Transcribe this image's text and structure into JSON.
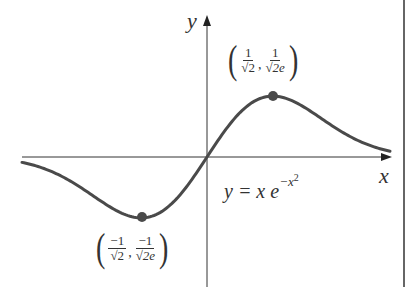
{
  "chart_data": {
    "type": "line",
    "title": "",
    "equation": "y = x e^{-x^2}",
    "xlabel": "x",
    "ylabel": "y",
    "grid": false,
    "legend": null,
    "xlim": [
      -2.0,
      2.1
    ],
    "ylim": [
      -0.9,
      1.1
    ],
    "series": [
      {
        "name": "y = x e^{-x^2}",
        "x": [
          -2.0,
          -1.75,
          -1.5,
          -1.25,
          -1.0,
          -0.75,
          -0.707,
          -0.5,
          -0.25,
          0.0,
          0.25,
          0.5,
          0.707,
          0.75,
          1.0,
          1.25,
          1.5,
          1.75,
          2.0
        ],
        "y": [
          -0.037,
          -0.082,
          -0.158,
          -0.262,
          -0.368,
          -0.427,
          -0.429,
          -0.389,
          -0.235,
          0.0,
          0.235,
          0.389,
          0.429,
          0.427,
          0.368,
          0.262,
          0.158,
          0.082,
          0.037
        ]
      }
    ],
    "annotations": [
      {
        "type": "point",
        "label": "(1/√2, 1/√(2e))",
        "x": 0.707,
        "y": 0.429,
        "role": "maximum"
      },
      {
        "type": "point",
        "label": "(−1/√2, −1/√(2e))",
        "x": -0.707,
        "y": -0.429,
        "role": "minimum"
      },
      {
        "type": "text",
        "label": "y = x e^{-x^2}",
        "position": "below x-axis, right of origin"
      }
    ]
  },
  "labels": {
    "y_axis": "y",
    "x_axis": "x",
    "equation_prefix": "y = x e",
    "equation_exp": "−x",
    "equation_exp_pow": "2",
    "max_point": {
      "x_num": "1",
      "x_den": "√2",
      "y_num": "1",
      "y_den": "√2e",
      "comma": ","
    },
    "min_point": {
      "x_num": "−1",
      "x_den": "√2",
      "y_num": "−1",
      "y_den": "√2e",
      "comma": ","
    }
  },
  "colors": {
    "curve": "#4a4a4a",
    "axes": "#333333",
    "point": "#4a4a4a",
    "border": "#333333"
  }
}
